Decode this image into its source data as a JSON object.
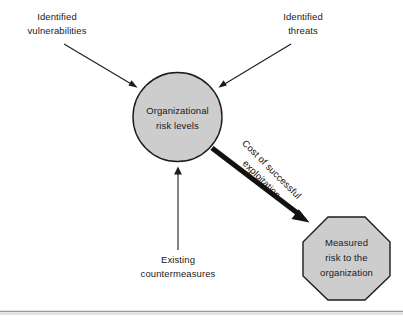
{
  "diagram": {
    "colors": {
      "shape_fill": "#cdcdcd",
      "shape_stroke": "#1c1c1c",
      "connector": "#1c1c1c",
      "thick_connector": "#111111",
      "text": "#1a1a1a",
      "rule": "#9a9a9a",
      "background": "#ffffff"
    },
    "nodes": [
      {
        "id": "organizational-risk-levels",
        "shape": "circle",
        "lines": [
          "Organizational",
          "risk levels"
        ],
        "line1": "Organizational",
        "line2": "risk levels"
      },
      {
        "id": "measured-risk",
        "shape": "octagon",
        "lines": [
          "Measured",
          "risk to the",
          "organization"
        ],
        "line1": "Measured",
        "line2": "risk to the",
        "line3": "organization"
      }
    ],
    "input_labels": [
      {
        "id": "identified-vulnerabilities",
        "line1": "Identified",
        "line2": "vulnerabilities"
      },
      {
        "id": "identified-threats",
        "line1": "Identified",
        "line2": "threats"
      },
      {
        "id": "existing-countermeasures",
        "line1": "Existing",
        "line2": "countermeasures"
      }
    ],
    "edge_labels": [
      {
        "id": "cost-of-successful-exploitation",
        "line1": "Cost of successful",
        "line2": "exploitation",
        "rotation_deg": 45
      }
    ]
  }
}
